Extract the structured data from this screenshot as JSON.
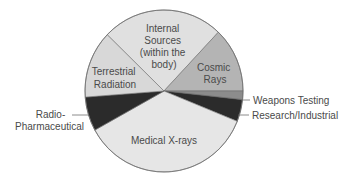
{
  "chart_data": {
    "type": "pie",
    "title": "",
    "start_angle_deg": 136,
    "direction": "clockwise",
    "slices": [
      {
        "label": "Internal Sources (within the body)",
        "value": 24.8,
        "color": "#e0e0e0"
      },
      {
        "label": "Cosmic Rays",
        "value": 12.9,
        "color": "#b4b4b4"
      },
      {
        "label": "Weapons Testing",
        "value": 1.7,
        "color": "#8c8c8c"
      },
      {
        "label": "Research/Industrial",
        "value": 4.4,
        "color": "#2b2b2b"
      },
      {
        "label": "Medical X-rays",
        "value": 35.8,
        "color": "#e6e6e6"
      },
      {
        "label": "Radio-Pharmaceutical",
        "value": 6.8,
        "color": "#2b2b2b"
      },
      {
        "label": "Terrestrial Radiation",
        "value": 13.4,
        "color": "#d8d8d8"
      }
    ],
    "values_unit": "percent (estimated from slice angles)",
    "legend": "none (labels placed on/next to slices)"
  },
  "labels": {
    "internal": [
      "Internal",
      "Sources",
      "(within the",
      "body)"
    ],
    "cosmic": [
      "Cosmic",
      "Rays"
    ],
    "terrestrial": [
      "Terrestrial",
      "Radiation"
    ],
    "medical": [
      "Medical X-rays"
    ],
    "radio": [
      "Radio-",
      "Pharmaceutical"
    ],
    "weapons": [
      "Weapons Testing"
    ],
    "research": [
      "Research/Industrial"
    ]
  }
}
